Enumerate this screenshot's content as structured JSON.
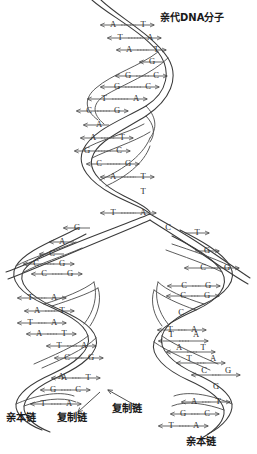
{
  "figure": {
    "title": "亲代DNA分子",
    "title_en_meaning": "parental DNA molecule",
    "background_color": "#ffffff",
    "line_color": "#3a3a3a",
    "text_color": "#2b2b2b"
  },
  "labels": {
    "parental_dna": "亲代DNA分子",
    "bottom_left_parent": "亲本链",
    "bottom_left_copy": "复制链",
    "bottom_right_copy": "复制链",
    "bottom_right_parent": "亲本链"
  },
  "chart_data": {
    "type": "diagram",
    "title": "亲代DNA分子",
    "segments": [
      {
        "id": "parental",
        "name": "parental-helix",
        "label": "亲代DNA分子",
        "pairs": [
          {
            "left": "A",
            "right": "T",
            "bond": "--"
          },
          {
            "left": "T",
            "right": "A",
            "bond": "---"
          },
          {
            "left": "A",
            "right": "T",
            "bond": "--"
          },
          {
            "left": "",
            "right": "G",
            "bond": ""
          },
          {
            "left": "G",
            "right": "C",
            "bond": "--"
          },
          {
            "left": "G",
            "right": "C",
            "bond": "---"
          },
          {
            "left": "T",
            "right": "A",
            "bond": "---"
          },
          {
            "left": "C",
            "right": "G",
            "bond": "--"
          },
          {
            "left": "A",
            "right": "",
            "bond": ""
          },
          {
            "left": "A",
            "right": "T",
            "bond": "--"
          },
          {
            "left": "G",
            "right": "C",
            "bond": "--"
          },
          {
            "left": "C",
            "right": "G",
            "bond": "--"
          },
          {
            "left": "A",
            "right": "T",
            "bond": "---"
          },
          {
            "left": "",
            "right": "T",
            "bond": ""
          },
          {
            "left": "T",
            "right": "A",
            "bond": "---"
          }
        ]
      },
      {
        "id": "daughter_left",
        "name": "left-daughter-helix",
        "strand_labels": [
          "亲本链",
          "复制链"
        ],
        "pairs": [
          {
            "left": "",
            "right": "G",
            "bond": ""
          },
          {
            "left": "",
            "right": "A",
            "bond": ""
          },
          {
            "left": "",
            "right": "C",
            "bond": ""
          },
          {
            "left": "C",
            "right": "G",
            "bond": "---"
          },
          {
            "left": "C",
            "right": "G",
            "bond": "--"
          },
          {
            "left": "T",
            "right": "A",
            "bond": "---"
          },
          {
            "left": "A",
            "right": "T",
            "bond": "---"
          },
          {
            "left": "T",
            "right": "A",
            "bond": "---"
          },
          {
            "left": "A",
            "right": "T",
            "bond": "---"
          },
          {
            "left": "T",
            "right": "A",
            "bond": "---"
          },
          {
            "left": "C",
            "right": "G",
            "bond": "---"
          },
          {
            "left": "A",
            "right": "T",
            "bond": "--"
          },
          {
            "left": "G",
            "right": "C",
            "bond": "--"
          },
          {
            "left": "A",
            "right": "T",
            "bond": "--"
          },
          {
            "left": "G",
            "right": "C",
            "bond": "--"
          },
          {
            "left": "T",
            "right": "A",
            "bond": "---"
          }
        ]
      },
      {
        "id": "daughter_right",
        "name": "right-daughter-helix",
        "strand_labels": [
          "复制链",
          "亲本链"
        ],
        "pairs": [
          {
            "left": "T",
            "right": "",
            "bond": ""
          },
          {
            "left": "G",
            "right": "",
            "bond": ""
          },
          {
            "left": "C",
            "right": "G",
            "bond": "--"
          },
          {
            "left": "C",
            "right": "G",
            "bond": "---"
          },
          {
            "left": "C",
            "right": "G",
            "bond": "--"
          },
          {
            "left": "C",
            "right": "",
            "bond": ""
          },
          {
            "left": "T",
            "right": "A",
            "bond": "---"
          },
          {
            "left": "T",
            "right": "A",
            "bond": "---"
          },
          {
            "left": "A",
            "right": "T",
            "bond": "--"
          },
          {
            "left": "T",
            "right": "A",
            "bond": "---"
          },
          {
            "left": "C",
            "right": "G",
            "bond": "--"
          },
          {
            "left": "",
            "right": "G",
            "bond": ""
          },
          {
            "left": "A",
            "right": "T",
            "bond": "--"
          },
          {
            "left": "G",
            "right": "C",
            "bond": "---"
          },
          {
            "left": "T",
            "right": "A",
            "bond": "---"
          }
        ]
      }
    ],
    "bases_top": [
      {
        "t": "A",
        "x": 113,
        "y": 25
      },
      {
        "t": "T",
        "x": 143,
        "y": 25
      },
      {
        "t": "T",
        "x": 120,
        "y": 38
      },
      {
        "t": "A",
        "x": 150,
        "y": 38
      },
      {
        "t": "A",
        "x": 129,
        "y": 50
      },
      {
        "t": "T",
        "x": 156,
        "y": 50
      },
      {
        "t": "G",
        "x": 152,
        "y": 62
      },
      {
        "t": "G",
        "x": 128,
        "y": 76
      },
      {
        "t": "C",
        "x": 156,
        "y": 76
      },
      {
        "t": "G",
        "x": 117,
        "y": 87
      },
      {
        "t": "C",
        "x": 148,
        "y": 87
      },
      {
        "t": "T",
        "x": 104,
        "y": 99
      },
      {
        "t": "A",
        "x": 136,
        "y": 99
      },
      {
        "t": "C",
        "x": 89,
        "y": 111
      },
      {
        "t": "G",
        "x": 117,
        "y": 111
      },
      {
        "t": "A",
        "x": 99,
        "y": 125
      },
      {
        "t": "A",
        "x": 93,
        "y": 138
      },
      {
        "t": "T",
        "x": 122,
        "y": 138
      },
      {
        "t": "G",
        "x": 87,
        "y": 151
      },
      {
        "t": "C",
        "x": 119,
        "y": 151
      },
      {
        "t": "C",
        "x": 99,
        "y": 164
      },
      {
        "t": "G",
        "x": 128,
        "y": 164
      },
      {
        "t": "A",
        "x": 113,
        "y": 177
      },
      {
        "t": "T",
        "x": 143,
        "y": 177
      },
      {
        "t": "T",
        "x": 143,
        "y": 192
      },
      {
        "t": "T",
        "x": 113,
        "y": 213
      },
      {
        "t": "A",
        "x": 143,
        "y": 213
      }
    ],
    "bases_left": [
      {
        "t": "G",
        "x": 77,
        "y": 228
      },
      {
        "t": "A",
        "x": 62,
        "y": 242
      },
      {
        "t": "C",
        "x": 52,
        "y": 254
      },
      {
        "t": "C",
        "x": 36,
        "y": 264
      },
      {
        "t": "G",
        "x": 62,
        "y": 264
      },
      {
        "t": "C",
        "x": 44,
        "y": 274
      },
      {
        "t": "G",
        "x": 70,
        "y": 274
      },
      {
        "t": "T",
        "x": 30,
        "y": 298
      },
      {
        "t": "A",
        "x": 54,
        "y": 298
      },
      {
        "t": "A",
        "x": 37,
        "y": 311
      },
      {
        "t": "T",
        "x": 62,
        "y": 311
      },
      {
        "t": "T",
        "x": 30,
        "y": 323
      },
      {
        "t": "A",
        "x": 54,
        "y": 323
      },
      {
        "t": "A",
        "x": 39,
        "y": 334
      },
      {
        "t": "T",
        "x": 64,
        "y": 334
      },
      {
        "t": "T",
        "x": 59,
        "y": 346
      },
      {
        "t": "A",
        "x": 84,
        "y": 346
      },
      {
        "t": "C",
        "x": 67,
        "y": 358
      },
      {
        "t": "G",
        "x": 91,
        "y": 358
      },
      {
        "t": "A",
        "x": 64,
        "y": 378
      },
      {
        "t": "T",
        "x": 88,
        "y": 378
      },
      {
        "t": "G",
        "x": 53,
        "y": 390
      },
      {
        "t": "C",
        "x": 78,
        "y": 390
      },
      {
        "t": "A",
        "x": 61,
        "y": 377
      },
      {
        "t": "T",
        "x": 43,
        "y": 404
      },
      {
        "t": "A",
        "x": 69,
        "y": 404
      }
    ],
    "bases_right": [
      {
        "t": "C",
        "x": 168,
        "y": 228
      },
      {
        "t": "T",
        "x": 197,
        "y": 233
      },
      {
        "t": "G",
        "x": 207,
        "y": 251
      },
      {
        "t": "C",
        "x": 203,
        "y": 268
      },
      {
        "t": "G",
        "x": 227,
        "y": 268
      },
      {
        "t": "C",
        "x": 184,
        "y": 286
      },
      {
        "t": "G",
        "x": 208,
        "y": 286
      },
      {
        "t": "C",
        "x": 183,
        "y": 296
      },
      {
        "t": "G",
        "x": 207,
        "y": 296
      },
      {
        "t": "C",
        "x": 181,
        "y": 313
      },
      {
        "t": "T",
        "x": 170,
        "y": 330
      },
      {
        "t": "A",
        "x": 194,
        "y": 330
      },
      {
        "t": "T",
        "x": 171,
        "y": 335
      },
      {
        "t": "A",
        "x": 196,
        "y": 335
      },
      {
        "t": "A",
        "x": 179,
        "y": 348
      },
      {
        "t": "T",
        "x": 203,
        "y": 348
      },
      {
        "t": "T",
        "x": 189,
        "y": 359
      },
      {
        "t": "A",
        "x": 213,
        "y": 359
      },
      {
        "t": "C",
        "x": 204,
        "y": 371
      },
      {
        "t": "G",
        "x": 228,
        "y": 371
      },
      {
        "t": "G",
        "x": 216,
        "y": 387
      },
      {
        "t": "A",
        "x": 194,
        "y": 402
      },
      {
        "t": "T",
        "x": 218,
        "y": 402
      },
      {
        "t": "G",
        "x": 183,
        "y": 414
      },
      {
        "t": "C",
        "x": 207,
        "y": 414
      },
      {
        "t": "T",
        "x": 171,
        "y": 426
      },
      {
        "t": "A",
        "x": 196,
        "y": 426
      }
    ]
  }
}
